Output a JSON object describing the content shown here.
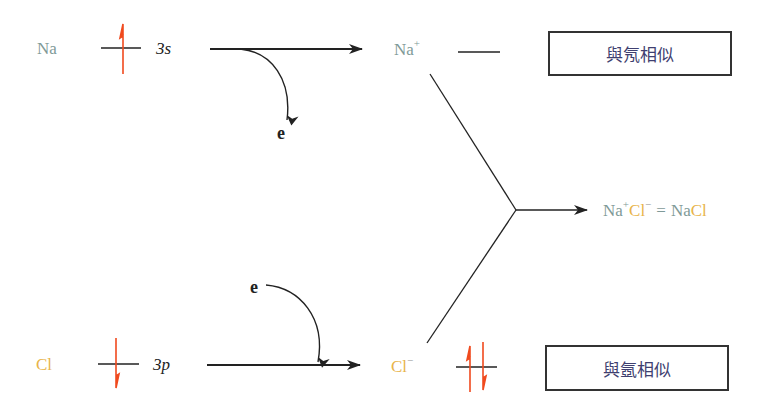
{
  "colors": {
    "sodium": "#7f9a98",
    "chlorine": "#e8b44a",
    "spin_arrow": "#f04a1e",
    "line": "#222222",
    "box_text": "#3f3f70"
  },
  "sodium": {
    "atom_label": "Na",
    "orbital_label": "3s",
    "ion_label": "Na",
    "ion_charge": "+",
    "electron_label": "e",
    "similar_box": "與氖相似"
  },
  "chlorine": {
    "atom_label": "Cl",
    "orbital_label": "3p",
    "ion_label": "Cl",
    "ion_charge": "−",
    "electron_label": "e",
    "similar_box": "與氬相似"
  },
  "product": {
    "cation": "Na",
    "cation_charge": "+",
    "anion": "Cl",
    "anion_charge": "−",
    "equals": "=",
    "formula_na": "Na",
    "formula_cl": "Cl"
  }
}
